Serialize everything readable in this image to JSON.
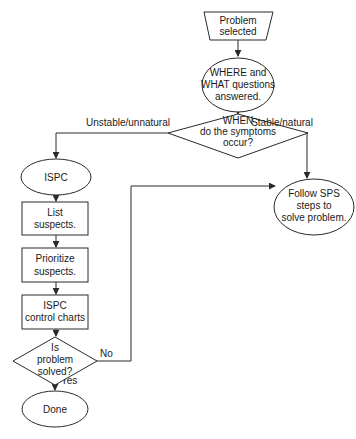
{
  "diagram": {
    "type": "flowchart",
    "nodes": {
      "start": {
        "shape": "trapezoid",
        "lines": [
          "Problem",
          "selected"
        ]
      },
      "where_what": {
        "shape": "ellipse",
        "lines": [
          "WHERE and",
          "WHAT questions",
          "answered."
        ]
      },
      "when_decision": {
        "shape": "diamond",
        "lines": [
          "WHEN",
          "do the symptoms",
          "occur?"
        ]
      },
      "ispc": {
        "shape": "ellipse",
        "lines": [
          "ISPC"
        ]
      },
      "list_suspects": {
        "shape": "rectangle",
        "lines": [
          "List",
          "suspects."
        ]
      },
      "prioritize_suspects": {
        "shape": "rectangle",
        "lines": [
          "Prioritize",
          "suspects."
        ]
      },
      "ispc_charts": {
        "shape": "rectangle",
        "lines": [
          "ISPC",
          "control charts"
        ]
      },
      "solved_decision": {
        "shape": "diamond",
        "lines": [
          "Is",
          "problem",
          "solved?"
        ]
      },
      "done": {
        "shape": "ellipse",
        "lines": [
          "Done"
        ]
      },
      "follow_sps": {
        "shape": "ellipse",
        "lines": [
          "Follow SPS",
          "steps to",
          "solve problem."
        ]
      }
    },
    "edges": {
      "unstable": {
        "from": "when_decision",
        "to": "ispc",
        "label": "Unstable/unnatural"
      },
      "stable": {
        "from": "when_decision",
        "to": "follow_sps",
        "label": "Stable/natural"
      },
      "no": {
        "from": "solved_decision",
        "to": "follow_sps",
        "label": "No"
      },
      "yes": {
        "from": "solved_decision",
        "to": "done",
        "label": "Yes"
      }
    },
    "colors": {
      "stroke": "#2a2a2a",
      "text": "#1a1a1a",
      "background": "#ffffff"
    }
  }
}
